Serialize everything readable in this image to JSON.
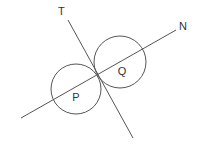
{
  "diagram": {
    "colors": {
      "stroke": "#555555",
      "label": "#333333",
      "background": "#ffffff"
    },
    "circles": [
      {
        "label": "P",
        "cx": 76,
        "cy": 89,
        "r": 25,
        "label_x": 76,
        "label_y": 101
      },
      {
        "label": "Q",
        "cx": 120,
        "cy": 62,
        "r": 26,
        "label_x": 122,
        "label_y": 75
      }
    ],
    "lines": [
      {
        "label": "T",
        "x1": 68,
        "y1": 20,
        "x2": 133,
        "y2": 138,
        "label_x": 58,
        "label_y": 15
      },
      {
        "label": "N",
        "x1": 21,
        "y1": 118,
        "x2": 176,
        "y2": 30,
        "label_x": 179,
        "label_y": 30
      }
    ],
    "tangent_point": {
      "x": 97,
      "y": 76
    }
  }
}
